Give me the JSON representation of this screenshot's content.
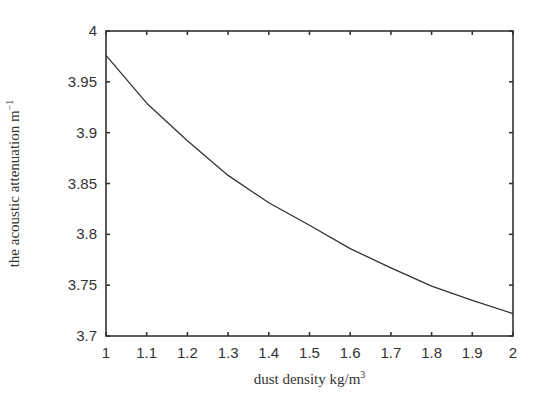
{
  "chart_data": {
    "type": "line",
    "title": "",
    "xlabel": "dust density kg/m",
    "xlabel_superscript": "3",
    "ylabel": "the acoustic attenuation m",
    "ylabel_superscript": "−1",
    "xlim": [
      1,
      2
    ],
    "ylim": [
      3.7,
      4
    ],
    "x_ticks": [
      1,
      1.1,
      1.2,
      1.3,
      1.4,
      1.5,
      1.6,
      1.7,
      1.8,
      1.9,
      2
    ],
    "x_tick_labels": [
      "1",
      "1.1",
      "1.2",
      "1.3",
      "1.4",
      "1.5",
      "1.6",
      "1.7",
      "1.8",
      "1.9",
      "2"
    ],
    "y_ticks": [
      3.7,
      3.75,
      3.8,
      3.85,
      3.9,
      3.95,
      4
    ],
    "y_tick_labels": [
      "3.7",
      "3.75",
      "3.8",
      "3.85",
      "3.9",
      "3.95",
      "4"
    ],
    "grid": false,
    "legend": null,
    "series": [
      {
        "name": "acoustic attenuation",
        "color": "#333333",
        "x": [
          1.0,
          1.1,
          1.2,
          1.3,
          1.4,
          1.5,
          1.6,
          1.7,
          1.8,
          1.9,
          2.0
        ],
        "values": [
          3.976,
          3.929,
          3.892,
          3.858,
          3.831,
          3.809,
          3.786,
          3.767,
          3.749,
          3.735,
          3.722
        ]
      }
    ]
  },
  "plot": {
    "left": 106,
    "right": 513,
    "top": 31,
    "bottom": 336,
    "axis_color": "#333333"
  }
}
